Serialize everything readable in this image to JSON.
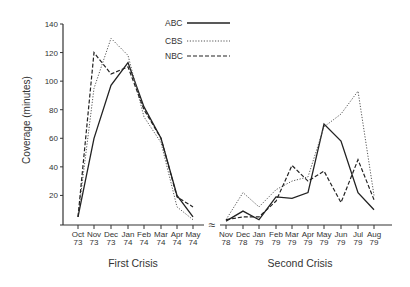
{
  "chart_data": {
    "type": "line",
    "title": "",
    "ylabel": "Coverage (minutes)",
    "ylim": [
      0,
      140
    ],
    "yticks": [
      20,
      40,
      60,
      80,
      100,
      120,
      140
    ],
    "grid": false,
    "legend": {
      "position": "top-center",
      "entries": [
        {
          "name": "ABC",
          "style": "solid"
        },
        {
          "name": "CBS",
          "style": "dotted"
        },
        {
          "name": "NBC",
          "style": "dashed"
        }
      ]
    },
    "axis_break_symbol": "≈",
    "panels": [
      {
        "label": "First Crisis",
        "categories": [
          "Oct 73",
          "Nov 73",
          "Dec 73",
          "Jan 74",
          "Feb 74",
          "Mar 74",
          "Apr 74",
          "May 74"
        ],
        "series": [
          {
            "name": "ABC",
            "values": [
              5,
              60,
              97,
              113,
              82,
              60,
              20,
              5
            ]
          },
          {
            "name": "CBS",
            "values": [
              5,
              95,
              130,
              118,
              75,
              57,
              12,
              3
            ]
          },
          {
            "name": "NBC",
            "values": [
              5,
              120,
              105,
              110,
              80,
              60,
              19,
              12
            ]
          }
        ]
      },
      {
        "label": "Second Crisis",
        "categories": [
          "Nov 78",
          "Dec 78",
          "Jan 79",
          "Feb 79",
          "Mar 79",
          "Apr 79",
          "May 79",
          "Jun 79",
          "Jul 79",
          "Aug 79"
        ],
        "series": [
          {
            "name": "ABC",
            "values": [
              2,
              9,
              3,
              19,
              18,
              22,
              70,
              58,
              22,
              10
            ]
          },
          {
            "name": "CBS",
            "values": [
              3,
              22,
              12,
              24,
              30,
              33,
              68,
              77,
              93,
              20
            ]
          },
          {
            "name": "NBC",
            "values": [
              3,
              5,
              5,
              16,
              41,
              30,
              37,
              15,
              45,
              17
            ]
          }
        ]
      }
    ]
  },
  "labels": {
    "ylabel": "Coverage (minutes)",
    "first_crisis": "First Crisis",
    "second_crisis": "Second Crisis",
    "break_symbol": "≈",
    "legend_abc": "ABC",
    "legend_cbs": "CBS",
    "legend_nbc": "NBC"
  }
}
